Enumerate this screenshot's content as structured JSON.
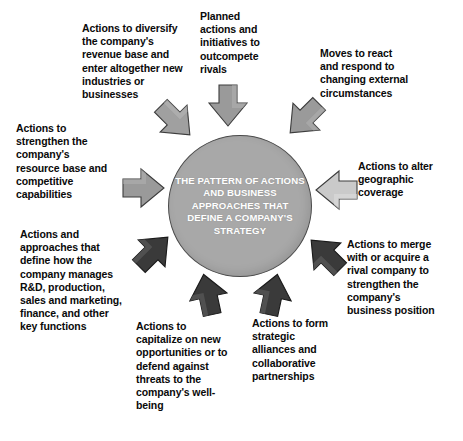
{
  "diagram": {
    "title": "The Pattern of Actions and Business Approaches That Define a Company's Strategy",
    "type": "hub-and-spoke",
    "hub": {
      "text": "THE PATTERN OF ACTIONS AND BUSINESS APPROACHES THAT DEFINE A COMPANY'S STRATEGY",
      "fill_color": "#a8a8a8",
      "text_color": "#ffffff",
      "border_color": "#4a4a4a"
    },
    "arrow_colors": {
      "light": "#a0a0a0",
      "dark": "#3a3a3a"
    },
    "spokes": [
      {
        "id": "diversify",
        "label": "Actions to diversify the company's revenue base and enter altogether new industries or businesses",
        "arrow": {
          "name": "arrow-diversify",
          "direction": "down-right",
          "shade": "light"
        }
      },
      {
        "id": "planned-actions",
        "label": "Planned actions and initiatives to outcompete rivals",
        "arrow": {
          "name": "arrow-planned-actions",
          "direction": "down",
          "shade": "light"
        }
      },
      {
        "id": "react-respond",
        "label": "Moves to react and respond to changing external circumstances",
        "arrow": {
          "name": "arrow-react-respond",
          "direction": "down-left",
          "shade": "light"
        }
      },
      {
        "id": "geographic-coverage",
        "label": "Actions to alter geographic coverage",
        "arrow": {
          "name": "arrow-geographic-coverage",
          "direction": "left",
          "shade": "light"
        }
      },
      {
        "id": "merge-acquire",
        "label": "Actions to merge with or acquire a rival company to strengthen the company's business position",
        "arrow": {
          "name": "arrow-merge-acquire",
          "direction": "up-left",
          "shade": "dark"
        }
      },
      {
        "id": "strategic-alliances",
        "label": "Actions to form strategic alliances and collaborative partnerships",
        "arrow": {
          "name": "arrow-strategic-alliances",
          "direction": "up",
          "shade": "dark"
        }
      },
      {
        "id": "capitalize-opportunities",
        "label": "Actions to capitalize on new opportunities or to defend against threats to the company's well-being",
        "arrow": {
          "name": "arrow-capitalize-opportunities",
          "direction": "up",
          "shade": "dark"
        }
      },
      {
        "id": "functional-approaches",
        "label": "Actions and approaches that define how the company manages R&D, production, sales and marketing, finance, and other key functions",
        "arrow": {
          "name": "arrow-functional-approaches",
          "direction": "up-right",
          "shade": "dark"
        }
      },
      {
        "id": "strengthen-resources",
        "label": "Actions to strengthen the company's resource base and competitive capabilities",
        "arrow": {
          "name": "arrow-strengthen-resources",
          "direction": "right",
          "shade": "light"
        }
      }
    ]
  }
}
